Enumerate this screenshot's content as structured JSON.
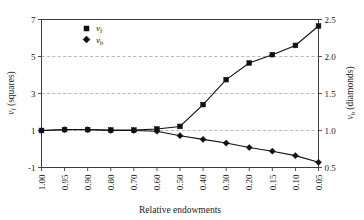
{
  "chart_data": {
    "type": "line",
    "title": "",
    "xlabel": "Relative endowments",
    "ylabel": "v_f (squares)",
    "y2label": "v_b (diamonds)",
    "categories": [
      "1.00",
      "0.95",
      "0.90",
      "0.80",
      "0.70",
      "0.60",
      "0.50",
      "0.40",
      "0.30",
      "0.20",
      "0.15",
      "0.10",
      "0.05"
    ],
    "x_tick_labels": [
      "1.00",
      "0.95",
      "0.90",
      "0.80",
      "0.70",
      "0.60",
      "0.50",
      "0.40",
      "0.30",
      "0.20",
      "0.15",
      "0.10",
      "0.05"
    ],
    "y_tick_labels": [
      "7",
      "5",
      "3",
      "1",
      "-1"
    ],
    "y_tick_values": [
      7,
      5,
      3,
      1,
      -1
    ],
    "ylim": [
      -1,
      7
    ],
    "y2_tick_labels": [
      "2.5",
      "2.0",
      "1.5",
      "1.0",
      "0.5"
    ],
    "y2_tick_values": [
      2.5,
      2.0,
      1.5,
      1.0,
      0.5
    ],
    "y2lim": [
      0.5,
      2.5
    ],
    "grid": "horizontal-dashed",
    "gridlines_at": [
      5,
      3,
      1
    ],
    "legend_position": "top-left",
    "series": [
      {
        "name": "v_f",
        "axis": "left",
        "marker": "square",
        "color": "#111111",
        "values": [
          1.0,
          1.05,
          1.05,
          1.03,
          1.02,
          1.08,
          1.22,
          2.4,
          3.75,
          4.65,
          5.1,
          5.6,
          6.65
        ]
      },
      {
        "name": "v_b",
        "axis": "right",
        "marker": "diamond",
        "color": "#111111",
        "values": [
          1.0,
          1.01,
          1.01,
          1.0,
          1.0,
          0.99,
          0.93,
          0.88,
          0.83,
          0.77,
          0.72,
          0.66,
          0.57
        ]
      }
    ]
  },
  "legend": {
    "entries": [
      {
        "symbol": "square",
        "base": "v",
        "sub": "f"
      },
      {
        "symbol": "diamond",
        "base": "v",
        "sub": "b"
      }
    ]
  },
  "axes": {
    "left_title_base": "v",
    "left_title_sub": "f",
    "left_title_rest": " (squares)",
    "right_title_base": "v",
    "right_title_sub": "b",
    "right_title_rest": " (diamonds)",
    "bottom_title": "Relative endowments"
  }
}
